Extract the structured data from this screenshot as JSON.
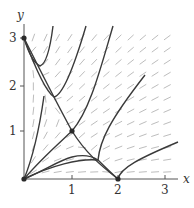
{
  "diagram": {
    "type": "phase-portrait",
    "axes": {
      "x_label": "x",
      "y_label": "y",
      "x_ticks": [
        "1",
        "2",
        "3"
      ],
      "y_ticks": [
        "1",
        "2",
        "3"
      ]
    },
    "equilibria": [
      {
        "x": 0,
        "y": 0
      },
      {
        "x": 0,
        "y": 3
      },
      {
        "x": 1,
        "y": 1
      },
      {
        "x": 2,
        "y": 0
      }
    ],
    "colors": {
      "trajectory": "#3a3a3a",
      "field": "#b8b8b8",
      "axis": "#555555"
    }
  }
}
